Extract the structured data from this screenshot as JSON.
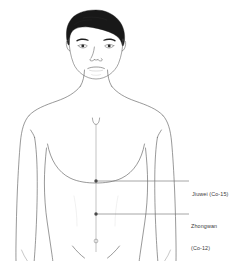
{
  "diagram": {
    "type": "anatomical-illustration",
    "background_color": "#ffffff",
    "outline_color": "#5a5a5a",
    "hair_color": "#1a1a1a",
    "leader_line_color": "#6e6e6e",
    "label_text_color": "#3a3a3a",
    "annotations": [
      {
        "id": "jiuwei",
        "name": "Jiuwei (Co-15)",
        "line1": "Jiuwei (Co-15)",
        "line2": "",
        "point_x": 96,
        "point_y": 181,
        "leader_end_x": 189,
        "leader_y": 181
      },
      {
        "id": "zhongwan",
        "name": "Zhongwan (Co-12)",
        "line1": "Zhongwan",
        "line2": "(Co-12)",
        "point_x": 96,
        "point_y": 214,
        "leader_end_x": 189,
        "leader_y": 214
      }
    ],
    "midline": {
      "name": "conception-vessel-midline",
      "x": 96,
      "top_y": 122,
      "bottom_y": 252
    },
    "navel": {
      "name": "navel",
      "x": 96,
      "y": 241
    }
  }
}
